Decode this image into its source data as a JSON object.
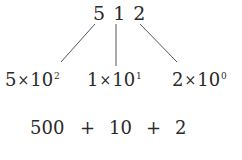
{
  "diagram": {
    "number": {
      "digits": [
        "5",
        "1",
        "2"
      ]
    },
    "expansion_terms": [
      {
        "digit": "5",
        "times": "×",
        "base": "10",
        "exponent": "2"
      },
      {
        "digit": "1",
        "times": "×",
        "base": "10",
        "exponent": "1"
      },
      {
        "digit": "2",
        "times": "×",
        "base": "10",
        "exponent": "0"
      }
    ],
    "sum": {
      "values": [
        "500",
        "10",
        "2"
      ],
      "operator": "+"
    },
    "line_color": "#555555",
    "text_color": "#2a2a2a"
  }
}
